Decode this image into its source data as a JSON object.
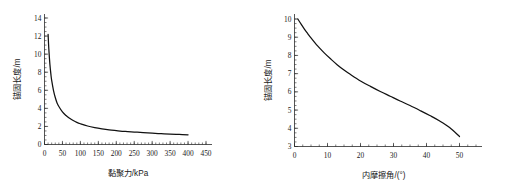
{
  "figure": {
    "background_color": "#ffffff",
    "curve_color": "#111111",
    "axis_color": "#2b2b2b"
  },
  "chart_data": [
    {
      "type": "line",
      "id": "cohesion-vs-anchorage-length",
      "title": "",
      "xlabel": "黏聚力/kPa",
      "ylabel": "锚固长度/m",
      "xlim": [
        0,
        450
      ],
      "ylim": [
        0,
        14
      ],
      "grid": false,
      "legend": null,
      "xticks": [
        0,
        50,
        100,
        150,
        200,
        250,
        300,
        350,
        400,
        450
      ],
      "xtick_labels": [
        "0",
        "50",
        "100",
        "150",
        "200",
        "250",
        "300",
        "350",
        "400",
        "450"
      ],
      "yticks": [
        0,
        2,
        4,
        6,
        8,
        10,
        12,
        14
      ],
      "ytick_labels": [
        "0",
        "2",
        "4",
        "6",
        "8",
        "10",
        "12",
        "14"
      ],
      "x": [
        10,
        12,
        15,
        18,
        20,
        25,
        30,
        35,
        40,
        50,
        60,
        70,
        80,
        90,
        100,
        120,
        140,
        160,
        180,
        200,
        225,
        250,
        275,
        300,
        325,
        350,
        375,
        400
      ],
      "y": [
        12.2,
        10.6,
        8.9,
        7.7,
        7.1,
        6.0,
        5.2,
        4.6,
        4.2,
        3.6,
        3.2,
        2.9,
        2.65,
        2.45,
        2.3,
        2.05,
        1.87,
        1.73,
        1.62,
        1.54,
        1.45,
        1.38,
        1.31,
        1.25,
        1.2,
        1.15,
        1.11,
        1.07
      ],
      "series": [
        {
          "name": "锚固长度",
          "values": [
            12.2,
            10.6,
            8.9,
            7.7,
            7.1,
            6.0,
            5.2,
            4.6,
            4.2,
            3.6,
            3.2,
            2.9,
            2.65,
            2.45,
            2.3,
            2.05,
            1.87,
            1.73,
            1.62,
            1.54,
            1.45,
            1.38,
            1.31,
            1.25,
            1.2,
            1.15,
            1.11,
            1.07
          ]
        }
      ]
    },
    {
      "type": "line",
      "id": "friction-angle-vs-anchorage-length",
      "title": "",
      "xlabel": "内摩擦角/(°)",
      "ylabel": "锚固长度/m",
      "xlim": [
        0,
        55
      ],
      "ylim": [
        3,
        10
      ],
      "grid": false,
      "legend": null,
      "xticks": [
        0,
        10,
        20,
        30,
        40,
        50
      ],
      "xtick_labels": [
        "0",
        "10",
        "20",
        "30",
        "40",
        "50"
      ],
      "yticks": [
        3,
        4,
        5,
        6,
        7,
        8,
        9,
        10
      ],
      "ytick_labels": [
        "3",
        "4",
        "5",
        "6",
        "7",
        "8",
        "9",
        "10"
      ],
      "x": [
        1,
        2,
        3,
        4,
        5,
        7,
        9,
        11,
        13,
        15,
        17,
        20,
        23,
        26,
        29,
        32,
        35,
        38,
        41,
        44,
        47,
        50
      ],
      "y": [
        10.0,
        9.72,
        9.45,
        9.2,
        8.96,
        8.52,
        8.14,
        7.8,
        7.48,
        7.2,
        6.95,
        6.6,
        6.3,
        6.02,
        5.76,
        5.5,
        5.25,
        4.98,
        4.7,
        4.4,
        4.04,
        3.55
      ],
      "series": [
        {
          "name": "锚固长度",
          "values": [
            10.0,
            9.72,
            9.45,
            9.2,
            8.96,
            8.52,
            8.14,
            7.8,
            7.48,
            7.2,
            6.95,
            6.6,
            6.3,
            6.02,
            5.76,
            5.5,
            5.25,
            4.98,
            4.7,
            4.4,
            4.04,
            3.55
          ]
        }
      ]
    }
  ]
}
